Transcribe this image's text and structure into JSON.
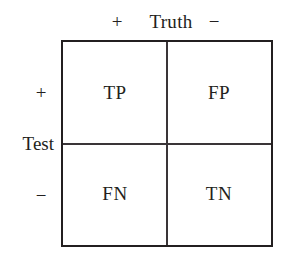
{
  "figure": {
    "colors": {
      "border": "#231f20",
      "divider": "#3a3538",
      "text": "#231f20",
      "background": "#ffffff"
    }
  },
  "top_axis": {
    "name": "Truth",
    "positive_symbol": "+",
    "negative_symbol": "−"
  },
  "left_axis": {
    "name": "Test",
    "positive_symbol": "+",
    "negative_symbol": "−"
  },
  "matrix": {
    "row_headers": [
      "+",
      "−"
    ],
    "column_headers": [
      "+",
      "−"
    ],
    "cells": [
      [
        "TP",
        "FP"
      ],
      [
        "FN",
        "TN"
      ]
    ]
  }
}
